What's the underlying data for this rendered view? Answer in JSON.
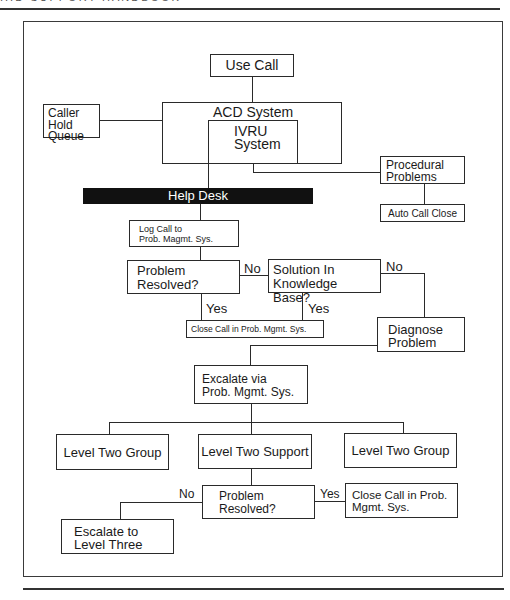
{
  "page": {
    "header_fragment": "...D SUPPORT HANDBOOK"
  },
  "flowchart": {
    "nodes": {
      "use_call": "Use Call",
      "caller_hold_queue": "Caller\nHold\nQueue",
      "acd_system": "ACD System",
      "ivru_system": "IVRU\nSystem",
      "procedural_problems": "Procedural\nProblems",
      "auto_call_close": "Auto Call Close",
      "help_desk": "Help Desk",
      "log_call": "Log Call to\nProb. Magmt. Sys.",
      "problem_resolved_1": "Problem\nResolved?",
      "solution_in_kb": "Solution In\nKnowledge Base?",
      "close_call_1": "Close Call in Prob. Mgmt. Sys.",
      "diagnose_problem": "Diagnose\nProblem",
      "excalate_via": "Excalate via\nProb. Mgmt. Sys.",
      "level_two_group_left": "Level Two Group",
      "level_two_support": "Level Two Support",
      "level_two_group_right": "Level Two Group",
      "problem_resolved_2": "Problem\nResolved?",
      "close_call_2": "Close Call in Prob.\nMgmt. Sys.",
      "escalate_level_three": "Escalate to\nLevel Three"
    },
    "edge_labels": {
      "pr1_no": "No",
      "pr1_yes": "Yes",
      "kb_no": "No",
      "kb_yes": "Yes",
      "pr2_no": "No",
      "pr2_yes": "Yes"
    }
  }
}
